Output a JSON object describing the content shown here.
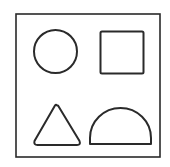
{
  "figure": {
    "stroke_color": "#2a2a2a",
    "background": "#ffffff",
    "shapes": [
      {
        "name": "circle",
        "position": "top-left"
      },
      {
        "name": "square",
        "position": "top-right"
      },
      {
        "name": "triangle",
        "position": "bottom-left"
      },
      {
        "name": "semicircle",
        "position": "bottom-right"
      }
    ]
  }
}
